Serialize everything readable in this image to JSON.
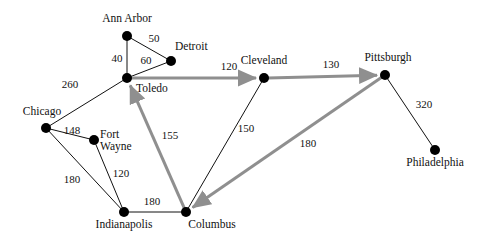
{
  "figure": {
    "background_color": "#ffffff",
    "thin_edge_color": "#111111",
    "thick_edge_color": "#8f8f8f",
    "node_color": "#000000"
  },
  "chart_data": {
    "type": "diagram",
    "subtype": "weighted-network-graph",
    "title": "",
    "xlabel": "",
    "ylabel": "",
    "grid": false,
    "legend": "none",
    "nodes": [
      {
        "id": "ann_arbor",
        "label": "Ann Arbor",
        "x": 127,
        "y": 36,
        "label_x": 127,
        "label_y": 22,
        "anchor": "middle"
      },
      {
        "id": "detroit",
        "label": "Detroit",
        "x": 171,
        "y": 61,
        "label_x": 175,
        "label_y": 50,
        "anchor": "start"
      },
      {
        "id": "toledo",
        "label": "Toledo",
        "x": 127,
        "y": 78,
        "label_x": 136,
        "label_y": 92,
        "anchor": "start"
      },
      {
        "id": "chicago",
        "label": "Chicago",
        "x": 46,
        "y": 128,
        "label_x": 42,
        "label_y": 115,
        "anchor": "middle"
      },
      {
        "id": "fort_wayne",
        "label": "Fort",
        "label2": "Wayne",
        "x": 94,
        "y": 140,
        "label_x": 100,
        "label_y": 138,
        "label2_x": 100,
        "label2_y": 150,
        "anchor": "start"
      },
      {
        "id": "cleveland",
        "label": "Cleveland",
        "x": 264,
        "y": 78,
        "label_x": 264,
        "label_y": 64,
        "anchor": "middle"
      },
      {
        "id": "pittsburgh",
        "label": "Pittsburgh",
        "x": 385,
        "y": 75,
        "label_x": 388,
        "label_y": 61,
        "anchor": "middle"
      },
      {
        "id": "philadelphia",
        "label": "Philadelphia",
        "x": 435,
        "y": 150,
        "label_x": 435,
        "label_y": 166,
        "anchor": "middle"
      },
      {
        "id": "indianapolis",
        "label": "Indianapolis",
        "x": 124,
        "y": 212,
        "label_x": 124,
        "label_y": 228,
        "anchor": "middle"
      },
      {
        "id": "columbus",
        "label": "Columbus",
        "x": 186,
        "y": 212,
        "label_x": 212,
        "label_y": 228,
        "anchor": "middle"
      }
    ],
    "edges": [
      {
        "id": "ann_arbor-detroit",
        "from": "ann_arbor",
        "to": "detroit",
        "weight": "50",
        "style": "thin",
        "arrow": false,
        "label_x": 154,
        "label_y": 42
      },
      {
        "id": "detroit-toledo",
        "from": "detroit",
        "to": "toledo",
        "weight": "60",
        "style": "thin",
        "arrow": false,
        "label_x": 146,
        "label_y": 64
      },
      {
        "id": "ann_arbor-toledo",
        "from": "ann_arbor",
        "to": "toledo",
        "weight": "40",
        "style": "thin",
        "arrow": false,
        "label_x": 117,
        "label_y": 62
      },
      {
        "id": "chicago-toledo",
        "from": "chicago",
        "to": "toledo",
        "weight": "260",
        "style": "thin",
        "arrow": false,
        "label_x": 70,
        "label_y": 88
      },
      {
        "id": "chicago-fort_wayne",
        "from": "chicago",
        "to": "fort_wayne",
        "weight": "148",
        "style": "thin",
        "arrow": false,
        "label_x": 72,
        "label_y": 134
      },
      {
        "id": "chicago-indianapolis",
        "from": "chicago",
        "to": "indianapolis",
        "weight": "180",
        "style": "thin",
        "arrow": false,
        "label_x": 72,
        "label_y": 183
      },
      {
        "id": "fort_wayne-indianapolis",
        "from": "fort_wayne",
        "to": "indianapolis",
        "weight": "120",
        "style": "thin",
        "arrow": false,
        "label_x": 121,
        "label_y": 177
      },
      {
        "id": "indianapolis-columbus",
        "from": "indianapolis",
        "to": "columbus",
        "weight": "180",
        "style": "thin",
        "arrow": false,
        "label_x": 152,
        "label_y": 205
      },
      {
        "id": "columbus-cleveland",
        "from": "columbus",
        "to": "cleveland",
        "weight": "150",
        "style": "thin",
        "arrow": false,
        "label_x": 246,
        "label_y": 132
      },
      {
        "id": "pittsburgh-philadelphia",
        "from": "pittsburgh",
        "to": "philadelphia",
        "weight": "320",
        "style": "thin",
        "arrow": false,
        "label_x": 424,
        "label_y": 108
      },
      {
        "id": "toledo-cleveland",
        "from": "toledo",
        "to": "cleveland",
        "weight": "120",
        "style": "thick",
        "arrow": true,
        "label_x": 229,
        "label_y": 70
      },
      {
        "id": "cleveland-pittsburgh",
        "from": "cleveland",
        "to": "pittsburgh",
        "weight": "130",
        "style": "thick",
        "arrow": true,
        "label_x": 331,
        "label_y": 68
      },
      {
        "id": "pittsburgh-columbus",
        "from": "pittsburgh",
        "to": "columbus",
        "weight": "180",
        "style": "thick",
        "arrow": true,
        "label_x": 308,
        "label_y": 147
      },
      {
        "id": "columbus-toledo",
        "from": "columbus",
        "to": "toledo",
        "weight": "155",
        "style": "thick",
        "arrow": true,
        "label_x": 170,
        "label_y": 139
      }
    ]
  }
}
